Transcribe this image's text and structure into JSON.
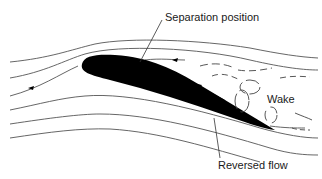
{
  "diagram": {
    "type": "aerofoil flow separation",
    "labels": {
      "separation_position": "Separation position",
      "wake": "Wake",
      "reversed_flow": "Reversed flow"
    },
    "colors": {
      "aerofoil": "#000000",
      "streamline": "#555555",
      "text": "#1a1a1a",
      "background": "#ffffff"
    },
    "elements": {
      "aerofoil": "black filled aerofoil at angle of attack",
      "streamlines": 6,
      "wake_eddies": "dashed curved lines and circular eddies behind trailing edge",
      "flow_arrows": [
        "freestream arrow upstream",
        "freestream arrow above aerofoil",
        "reversed flow arrow on upper surface"
      ]
    }
  }
}
